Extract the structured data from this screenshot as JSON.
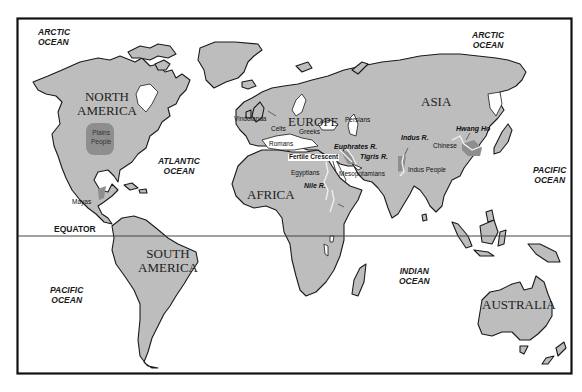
{
  "map": {
    "title": "World map of ancient civilizations",
    "colors": {
      "land": "#bdbdbd",
      "region": "#8e8e8e",
      "river": "#f2f2f2",
      "outline": "#1a1a1a",
      "background": "#ffffff"
    },
    "oceans": [
      {
        "id": "arctic-nw",
        "line1": "ARCTIC",
        "line2": "OCEAN"
      },
      {
        "id": "arctic-ne",
        "line1": "ARCTIC",
        "line2": "OCEAN"
      },
      {
        "id": "atlantic",
        "line1": "ATLANTIC",
        "line2": "OCEAN"
      },
      {
        "id": "pacific-e",
        "line1": "PACIFIC",
        "line2": "OCEAN"
      },
      {
        "id": "pacific-w",
        "line1": "PACIFIC",
        "line2": "OCEAN"
      },
      {
        "id": "indian",
        "line1": "INDIAN",
        "line2": "OCEAN"
      }
    ],
    "continents": [
      {
        "id": "north-america",
        "line1": "NORTH",
        "line2": "AMERICA"
      },
      {
        "id": "south-america",
        "line1": "SOUTH",
        "line2": "AMERICA"
      },
      {
        "id": "europe",
        "line1": "EUROPE"
      },
      {
        "id": "asia",
        "line1": "ASIA"
      },
      {
        "id": "africa",
        "line1": "AFRICA"
      },
      {
        "id": "australia",
        "line1": "AUSTRALIA"
      }
    ],
    "peoples": {
      "plains_people_1": "Plains",
      "plains_people_2": "People",
      "mayas": "Mayas",
      "vindolanda": "Vindolanda",
      "celts": "Celts",
      "greeks": "Greeks",
      "persians": "Persians",
      "romans": "Romans",
      "fertile_crescent": "Fertile Crescent",
      "egyptians": "Egyptians",
      "mesopotamians": "Mesopotamians",
      "indus_people": "Indus People",
      "chinese": "Chinese"
    },
    "rivers": {
      "euphrates": "Euphrates R.",
      "tigris": "Tigris R.",
      "nile": "Nile R.",
      "indus": "Indus R.",
      "hwang_ho": "Hwang Ho"
    },
    "equator": "EQUATOR"
  }
}
